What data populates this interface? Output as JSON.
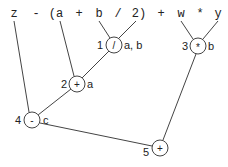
{
  "diagram": {
    "expression_tokens": [
      {
        "text": "z",
        "x": 14
      },
      {
        "text": "-",
        "x": 36
      },
      {
        "text": "(a",
        "x": 56
      },
      {
        "text": "+",
        "x": 79
      },
      {
        "text": "b",
        "x": 99
      },
      {
        "text": "/",
        "x": 118
      },
      {
        "text": "2)",
        "x": 139
      },
      {
        "text": "+",
        "x": 161
      },
      {
        "text": "w",
        "x": 181
      },
      {
        "text": "*",
        "x": 200
      },
      {
        "text": "y",
        "x": 218
      }
    ],
    "nodes": [
      {
        "id": "1",
        "op": "/",
        "annotation": "a, b",
        "cx": 114,
        "cy": 45
      },
      {
        "id": "2",
        "op": "+",
        "annotation": "a",
        "cx": 77,
        "cy": 84
      },
      {
        "id": "3",
        "op": "*",
        "annotation": "b",
        "cx": 198,
        "cy": 46
      },
      {
        "id": "4",
        "op": "-",
        "annotation": "c",
        "cx": 32,
        "cy": 120
      },
      {
        "id": "5",
        "op": "+",
        "annotation": "",
        "cx": 160,
        "cy": 148
      }
    ],
    "edges": [
      {
        "from": "b",
        "to": "1"
      },
      {
        "from": "2",
        "to": "1"
      },
      {
        "from": "a",
        "to": "2"
      },
      {
        "from": "1",
        "to": "2"
      },
      {
        "from": "w",
        "to": "3"
      },
      {
        "from": "y",
        "to": "3"
      },
      {
        "from": "z",
        "to": "4"
      },
      {
        "from": "2",
        "to": "4"
      },
      {
        "from": "4",
        "to": "5"
      },
      {
        "from": "3",
        "to": "5"
      }
    ]
  }
}
